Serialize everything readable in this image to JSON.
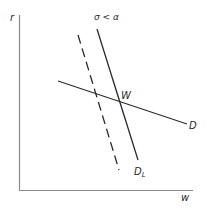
{
  "figure": {
    "axes": {
      "y_label": "r",
      "x_label": "w",
      "y_axis": {
        "x": 19.5,
        "y1": 15,
        "y2": 190
      },
      "x_axis": {
        "y": 190.5,
        "x1": 19,
        "x2": 193
      }
    },
    "annotation": "σ < α",
    "curves": [
      {
        "name": "D",
        "label": "D",
        "style": "solid",
        "x1": 58,
        "y1": 81,
        "x2": 187,
        "y2": 124
      },
      {
        "name": "D_L",
        "label": "D",
        "subscript": "L",
        "style": "solid",
        "x1": 97,
        "y1": 29,
        "x2": 138,
        "y2": 160
      },
      {
        "name": "D_L_shifted",
        "label": "",
        "style": "dashed",
        "x1": 78,
        "y1": 35,
        "x2": 119,
        "y2": 170
      }
    ],
    "points": [
      {
        "label": "W",
        "x": 119,
        "y": 101
      }
    ],
    "colors": {
      "line": "#2a2a2a",
      "axis": "#8a8a8a",
      "background": "#ffffff"
    }
  }
}
